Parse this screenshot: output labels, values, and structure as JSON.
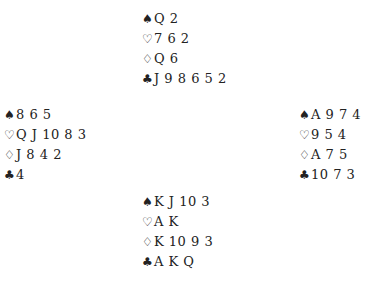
{
  "suits": {
    "spades": "♠",
    "hearts": "♡",
    "diamonds": "♢",
    "clubs": "♣"
  },
  "hands": {
    "north": {
      "spades": "Q 2",
      "hearts": "7 6 2",
      "diamonds": "Q 6",
      "clubs": "J 9 8 6 5 2"
    },
    "west": {
      "spades": "8 6 5",
      "hearts": "Q J 10 8 3",
      "diamonds": "J 8 4 2",
      "clubs": "4"
    },
    "east": {
      "spades": "A 9 7 4",
      "hearts": "9 5 4",
      "diamonds": "A 7 5",
      "clubs": "10 7 3"
    },
    "south": {
      "spades": "K J 10 3",
      "hearts": "A K",
      "diamonds": "K 10 9 3",
      "clubs": "A K Q"
    }
  }
}
